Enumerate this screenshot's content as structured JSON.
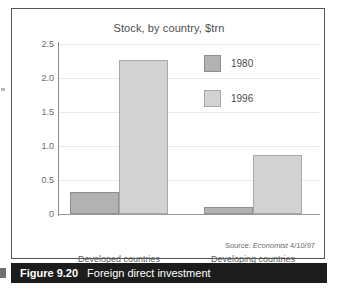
{
  "figure": {
    "caption_number": "Figure 9.20",
    "caption_title": "Foreign direct investment",
    "source_prefix": "Source:",
    "source_publication": "Economist",
    "source_date": "4/10/97"
  },
  "legend": {
    "items": [
      {
        "label": "1980",
        "color": "#b2b2b2"
      },
      {
        "label": "1996",
        "color": "#d2d2d2"
      }
    ]
  },
  "chart_data": {
    "type": "bar",
    "title": "Stock, by country, $trn",
    "xlabel": "",
    "ylabel": "",
    "ylim": [
      0,
      2.5
    ],
    "ytick_labels": [
      "2.5",
      "2.0",
      "1.5",
      "1.0",
      "0.5",
      "0"
    ],
    "yticks": [
      2.5,
      2.0,
      1.5,
      1.0,
      0.5,
      0
    ],
    "grid": true,
    "legend_position": "inside-top-right",
    "categories": [
      "Developed countries",
      "Developing countries"
    ],
    "series": [
      {
        "name": "1980",
        "color": "#b2b2b2",
        "values": [
          0.33,
          0.1
        ]
      },
      {
        "name": "1996",
        "color": "#d2d2d2",
        "values": [
          2.26,
          0.87
        ]
      }
    ]
  }
}
